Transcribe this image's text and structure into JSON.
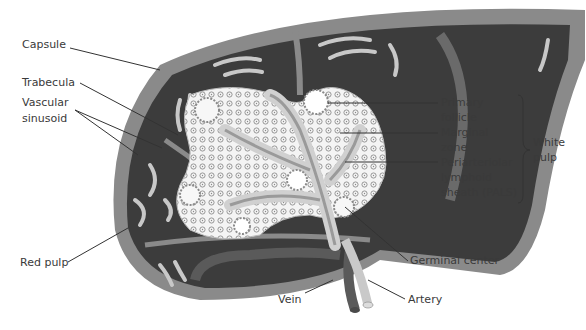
{
  "diagram": {
    "labels_left": {
      "capsule": "Capsule",
      "trabecula": "Trabecula",
      "vascular_sinusoid_1": "Vascular",
      "vascular_sinusoid_2": "sinusoid",
      "red_pulp": "Red pulp"
    },
    "labels_right": {
      "primary_follicle_1": "Primary",
      "primary_follicle_2": "follicle",
      "marginal_zone_1": "Marginal",
      "marginal_zone_2": "zone",
      "pals_1": "Periarteriolar",
      "pals_2": "lymphoid",
      "pals_3": "sheath (PALS)",
      "white_pulp_1": "White",
      "white_pulp_2": "pulp",
      "germinal_center": "Germinal center"
    },
    "labels_bottom": {
      "vein": "Vein",
      "artery": "Artery"
    },
    "colors": {
      "capsule": "#8a8a8a",
      "red_pulp": "#3c3c3c",
      "white_pulp": "#f2f2f2",
      "sinusoid": "#c8c8c8",
      "vein": "#5a5a5a",
      "artery": "#c9c9c9"
    }
  }
}
